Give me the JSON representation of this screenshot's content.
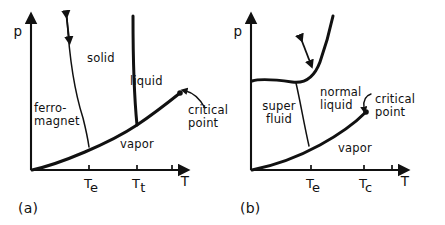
{
  "figure": {
    "background_color": "#ffffff",
    "ink_color": "#111111",
    "width": 445,
    "height": 225
  },
  "chart_data": [
    {
      "type": "line",
      "title": "(a)",
      "subtitle": "Ferromagnet / solid / liquid / vapor phase diagram",
      "xlabel": "T",
      "ylabel": "p",
      "grid": false,
      "legend": "none",
      "axis_origin": [
        31,
        170
      ],
      "xlim_px": [
        31,
        180
      ],
      "ylim_px": [
        170,
        22
      ],
      "xticks": [
        {
          "label": "T_e",
          "base": "T",
          "sub": "e",
          "x_px": 89
        },
        {
          "label": "T_t",
          "base": "T",
          "sub": "t",
          "x_px": 137
        },
        {
          "label": "",
          "base": "",
          "sub": "",
          "x_px": 172
        }
      ],
      "regions": [
        {
          "name": "ferro-magnet",
          "lines": [
            "ferro-",
            "magnet"
          ],
          "x_px": 34,
          "y_px": 112,
          "align": "left"
        },
        {
          "name": "solid",
          "lines": [
            "solid"
          ],
          "x_px": 87,
          "y_px": 62,
          "align": "left"
        },
        {
          "name": "liquid",
          "lines": [
            "liquid"
          ],
          "x_px": 130,
          "y_px": 85,
          "align": "left"
        },
        {
          "name": "vapor",
          "lines": [
            "vapor"
          ],
          "x_px": 120,
          "y_px": 148,
          "align": "left"
        }
      ],
      "boundaries": [
        {
          "name": "curie-line",
          "style": "thin",
          "description": "ferromagnet / solid boundary, steep nearly vertical curve",
          "path": "M 67,18 C 69,52 74,90 83,118 C 86,130 88,140 89,147"
        },
        {
          "name": "melting-line",
          "style": "thick",
          "description": "solid / liquid boundary rising steeply from triple point",
          "path": "M 137,125 C 134,95 133,60 133,16"
        },
        {
          "name": "vaporization-line",
          "style": "thick",
          "description": "liquid-vapor coexistence curve from origin through triple point to critical point",
          "path": "M 32,170 C 60,164 110,143 137,125 C 155,113 170,101 180,93"
        }
      ],
      "annotations": [
        {
          "name": "critical-point",
          "lines": [
            "critical",
            "point"
          ],
          "x_px": 188,
          "y_px": 114,
          "marker_px": [
            180,
            93
          ],
          "leader": "M 205,108 C 200,99 194,93 186,91"
        },
        {
          "name": "transition-arrow",
          "type": "double-headed-arrow",
          "from_px": [
            66,
            12
          ],
          "to_px": [
            69,
            38
          ]
        }
      ]
    },
    {
      "type": "line",
      "title": "(b)",
      "subtitle": "Superfluid / normal liquid / vapor phase diagram (helium-4)",
      "xlabel": "T",
      "ylabel": "p",
      "grid": false,
      "legend": "none",
      "axis_origin": [
        251,
        170
      ],
      "xlim_px": [
        251,
        400
      ],
      "ylim_px": [
        170,
        22
      ],
      "xticks": [
        {
          "label": "T_e",
          "base": "T",
          "sub": "e",
          "x_px": 311
        },
        {
          "label": "T_c",
          "base": "T",
          "sub": "c",
          "x_px": 364
        },
        {
          "label": "",
          "base": "",
          "sub": "",
          "x_px": 392
        }
      ],
      "regions": [
        {
          "name": "super-fluid",
          "lines": [
            "super",
            "fluid"
          ],
          "x_px": 279,
          "y_px": 110,
          "align": "center"
        },
        {
          "name": "normal-liquid",
          "lines": [
            "normal",
            "liquid"
          ],
          "x_px": 320,
          "y_px": 96,
          "align": "left"
        },
        {
          "name": "vapor",
          "lines": [
            "vapor"
          ],
          "x_px": 338,
          "y_px": 152,
          "align": "left"
        }
      ],
      "boundaries": [
        {
          "name": "melting-line",
          "style": "thick",
          "description": "solidification boundary: flat plateau then steep rise at right",
          "path": "M 252,81 C 262,78 278,80 292,82 C 305,84 314,78 320,62 C 326,45 330,30 333,16"
        },
        {
          "name": "lambda-line",
          "style": "thin",
          "description": "superfluid / normal liquid lambda transition line",
          "path": "M 296,83 C 300,100 304,124 309,146"
        },
        {
          "name": "vaporization-line",
          "style": "thick",
          "description": "liquid-vapor coexistence from origin to critical point",
          "path": "M 252,170 C 272,166 298,157 320,145 C 342,133 358,120 366,112"
        }
      ],
      "annotations": [
        {
          "name": "critical-point",
          "lines": [
            "critical",
            "point"
          ],
          "x_px": 375,
          "y_px": 103,
          "marker_px": [
            366,
            112
          ],
          "leader": "M 371,94 C 365,96 363,101 364,108"
        },
        {
          "name": "transition-arrow",
          "type": "double-headed-arrow",
          "from_px": [
            300,
            36
          ],
          "to_px": [
            310,
            62
          ]
        }
      ]
    }
  ],
  "panel_labels": [
    {
      "name": "panel-a-label",
      "text": "(a)",
      "x_px": 18,
      "y_px": 213
    },
    {
      "name": "panel-b-label",
      "text": "(b)",
      "x_px": 240,
      "y_px": 213
    }
  ],
  "axis_labels": {
    "pressure": "p",
    "temperature": "T"
  }
}
